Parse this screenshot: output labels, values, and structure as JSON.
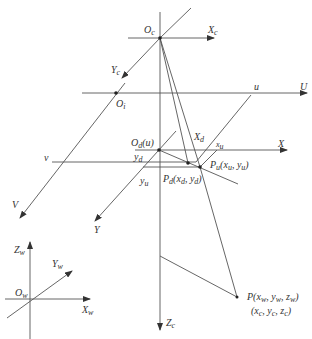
{
  "diagram": {
    "type": "camera-imaging-model",
    "labels": {
      "Oc": "O",
      "Oc_sub": "c",
      "Xc": "X",
      "Xc_sub": "c",
      "Yc": "Y",
      "Yc_sub": "c",
      "Zc": "Z",
      "Zc_sub": "c",
      "Oi": "O",
      "Oi_sub": "i",
      "u_top": "u",
      "U": "U",
      "V": "V",
      "v": "v",
      "Od": "O",
      "Od_sub": "d",
      "Od_suffix": "(u)",
      "Xd": "X",
      "Xd_sub": "d",
      "xu": "x",
      "xu_sub": "u",
      "X": "X",
      "Y": "Y",
      "yd": "y",
      "yd_sub": "d",
      "yu": "y",
      "yu_sub": "u",
      "Pu": "P",
      "Pu_sub": "u",
      "Pu_coords": "(xᵤ, yᵤ)",
      "Pd": "P",
      "Pd_sub": "d",
      "Pd_coords": "(xᵈ, yᵈ)",
      "P_line1": "P(xᵥₓ, yᵥₓ, zᵥₓ)",
      "P_world": "P(xw, yw, zw)",
      "P_cam": "(xc, yc, zc)",
      "Zw": "Z",
      "Zw_sub": "w",
      "Yw": "Y",
      "Yw_sub": "w",
      "Ow": "O",
      "Ow_sub": "w",
      "Xw": "X",
      "Xw_sub": "w"
    },
    "colors": {
      "line": "#555555",
      "text": "#333333",
      "background": "#ffffff"
    }
  }
}
